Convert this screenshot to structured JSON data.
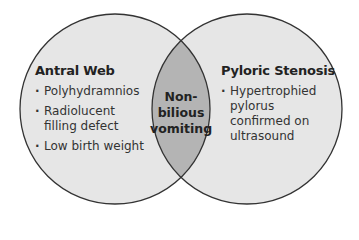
{
  "diagram": {
    "type": "venn",
    "colors": {
      "circle_fill": "#e6e6e6",
      "overlap_fill": "#b4b4b4",
      "stroke": "#333333",
      "background": "#ffffff"
    },
    "left": {
      "title": "Antral Web",
      "items": [
        "Polyhydramnios",
        "Radiolucent filling defect",
        "Low birth weight"
      ]
    },
    "right": {
      "title": "Pyloric Stenosis",
      "items": [
        "Hypertrophied pylorus confirmed on ultrasound"
      ]
    },
    "overlap": {
      "lines": [
        "Non-",
        "bilious",
        "vomiting"
      ]
    }
  }
}
